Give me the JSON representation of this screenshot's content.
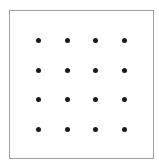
{
  "diagram": {
    "type": "dot-grid",
    "rows": 4,
    "columns": 4,
    "dot_color": "#1a1a1a",
    "border_color": "#a0a0a0",
    "dot_x": [
      38,
      67,
      95,
      124
    ],
    "dot_y": [
      40,
      70,
      99,
      129
    ]
  }
}
